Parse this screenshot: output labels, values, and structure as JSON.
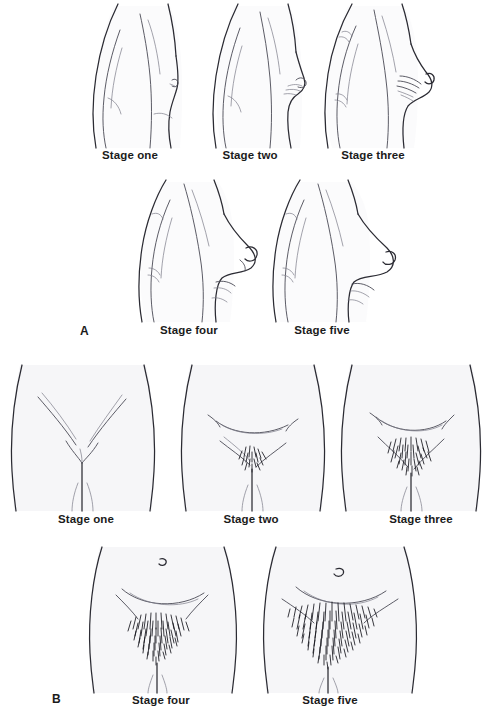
{
  "figure": {
    "background_color": "#ffffff",
    "ink_color": "#2b2b33",
    "text_color": "#1b1b1b"
  },
  "panels": [
    {
      "letter": "A",
      "subject": "breast-development",
      "view": "lateral-profile-torso",
      "rows": [
        {
          "captions": [
            {
              "label": "Stage one",
              "stage": 1,
              "cx": 130,
              "cy": 157
            },
            {
              "label": "Stage two",
              "stage": 2,
              "cx": 250,
              "cy": 157
            },
            {
              "label": "Stage three",
              "stage": 3,
              "cx": 373,
              "cy": 157
            }
          ]
        },
        {
          "captions": [
            {
              "label": "Stage four",
              "stage": 4,
              "cx": 189,
              "cy": 332
            },
            {
              "label": "Stage five",
              "stage": 5,
              "cx": 322,
              "cy": 332
            }
          ]
        }
      ],
      "letter_pos": {
        "x": 80,
        "y": 324
      }
    },
    {
      "letter": "B",
      "subject": "pubic-hair-development",
      "view": "anterior-pelvis",
      "rows": [
        {
          "captions": [
            {
              "label": "Stage one",
              "stage": 1,
              "cx": 86,
              "cy": 521
            },
            {
              "label": "Stage two",
              "stage": 2,
              "cx": 251,
              "cy": 521
            },
            {
              "label": "Stage three",
              "stage": 3,
              "cx": 421,
              "cy": 521
            }
          ]
        },
        {
          "captions": [
            {
              "label": "Stage four",
              "stage": 4,
              "cx": 161,
              "cy": 702
            },
            {
              "label": "Stage five",
              "stage": 5,
              "cx": 330,
              "cy": 702
            }
          ]
        }
      ],
      "letter_pos": {
        "x": 52,
        "y": 695
      }
    }
  ]
}
